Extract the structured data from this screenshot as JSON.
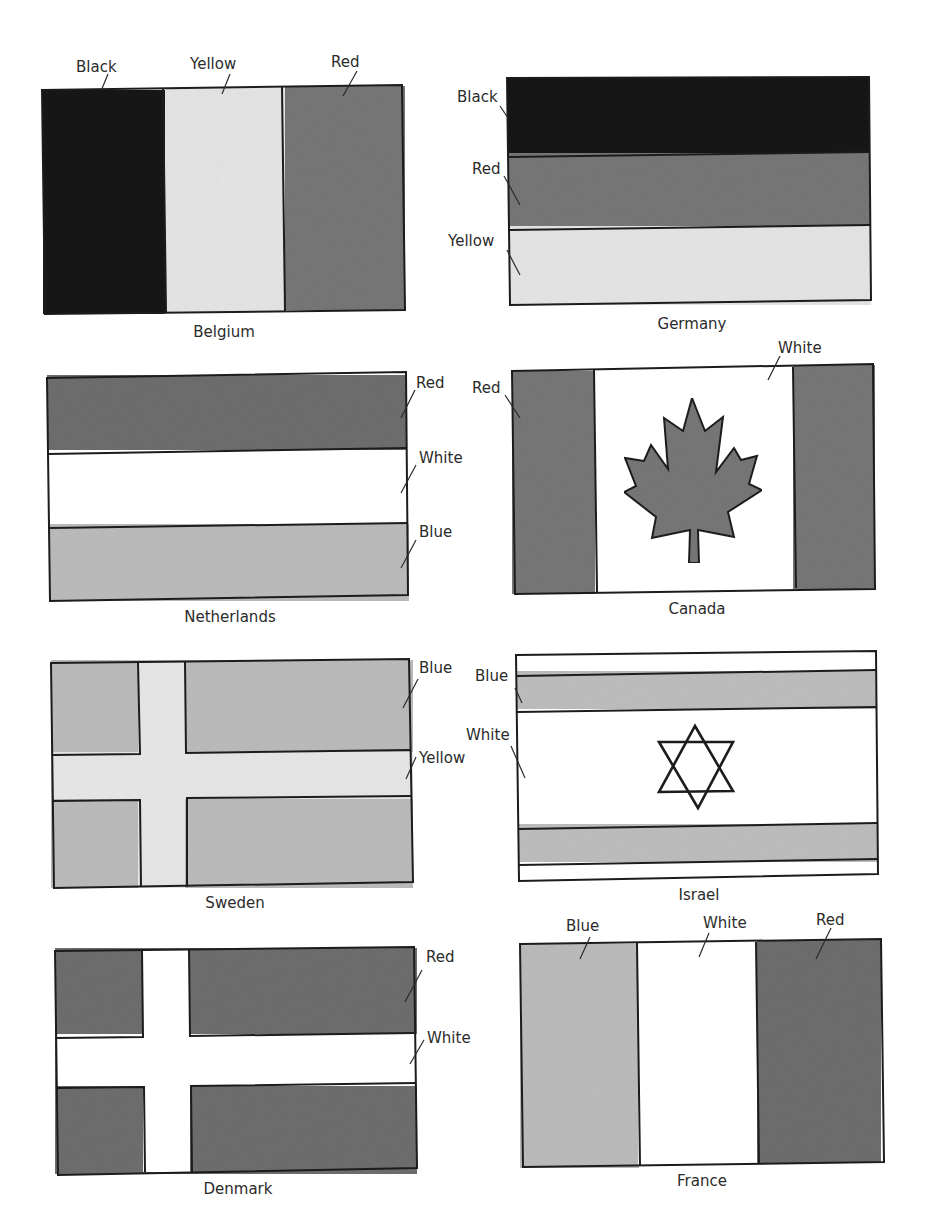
{
  "colors": {
    "black": "#141414",
    "red": "#777777",
    "red_dark": "#6a6a6a",
    "yellow": "#e6e6e6",
    "white": "#ffffff",
    "blue": "#bdbdbd",
    "outline": "#1c1c1c"
  },
  "flags": [
    {
      "id": "belgium",
      "caption": "Belgium",
      "labels": [
        "Black",
        "Yellow",
        "Red"
      ]
    },
    {
      "id": "germany",
      "caption": "Germany",
      "labels": [
        "Black",
        "Red",
        "Yellow"
      ]
    },
    {
      "id": "netherlands",
      "caption": "Netherlands",
      "labels": [
        "Red",
        "White",
        "Blue"
      ]
    },
    {
      "id": "canada",
      "caption": "Canada",
      "labels": [
        "Red",
        "White"
      ]
    },
    {
      "id": "sweden",
      "caption": "Sweden",
      "labels": [
        "Blue",
        "Yellow"
      ]
    },
    {
      "id": "israel",
      "caption": "Israel",
      "labels": [
        "Blue",
        "White"
      ]
    },
    {
      "id": "denmark",
      "caption": "Denmark",
      "labels": [
        "Red",
        "White"
      ]
    },
    {
      "id": "france",
      "caption": "France",
      "labels": [
        "Blue",
        "White",
        "Red"
      ]
    }
  ],
  "icons": {
    "canada_emblem": "maple-leaf-icon",
    "israel_emblem": "star-of-david-icon"
  }
}
